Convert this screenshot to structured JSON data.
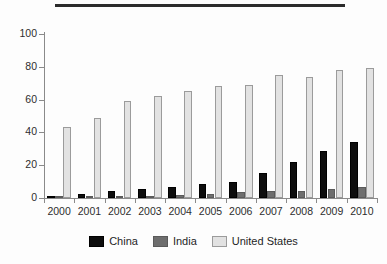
{
  "chart_data": {
    "type": "bar",
    "title": "",
    "subtitle": "",
    "xlabel": "",
    "ylabel": "",
    "ylim": [
      0,
      100
    ],
    "yticks": [
      0,
      20,
      40,
      60,
      80,
      100
    ],
    "grid": false,
    "legend_position": "bottom",
    "categories": [
      "2000",
      "2001",
      "2002",
      "2003",
      "2004",
      "2005",
      "2006",
      "2007",
      "2008",
      "2009",
      "2010"
    ],
    "series": [
      {
        "name": "China",
        "color": "#0d0d0d",
        "values": [
          1.5,
          2.5,
          4.5,
          5.5,
          7,
          8.5,
          10,
          15.5,
          22,
          28.5,
          34
        ]
      },
      {
        "name": "India",
        "color": "#6e6e6e",
        "values": [
          0.5,
          1,
          1.5,
          1.5,
          2,
          2.5,
          3.5,
          4,
          4.5,
          5.5,
          7
        ]
      },
      {
        "name": "United States",
        "color": "#e2e2e2",
        "values": [
          43,
          49,
          59,
          62,
          65,
          68,
          69,
          75,
          74,
          78,
          79
        ]
      }
    ]
  },
  "legend": {
    "entries": [
      {
        "label": "China"
      },
      {
        "label": "India"
      },
      {
        "label": "United States"
      }
    ]
  }
}
